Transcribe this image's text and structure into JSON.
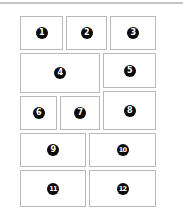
{
  "diagram": {
    "type": "layout-grid",
    "colors": {
      "border": "#b9b9b9",
      "badge_bg": "#0a0a0a",
      "badge_fg": "#ffffff",
      "top_rule": "#c4c4c4"
    },
    "panels": [
      {
        "label": "1",
        "x": 20,
        "y": 16,
        "w": 43,
        "h": 34
      },
      {
        "label": "2",
        "x": 66,
        "y": 16,
        "w": 41,
        "h": 34
      },
      {
        "label": "3",
        "x": 110,
        "y": 16,
        "w": 46,
        "h": 34
      },
      {
        "label": "4",
        "x": 20,
        "y": 53,
        "w": 80,
        "h": 40
      },
      {
        "label": "5",
        "x": 103,
        "y": 53,
        "w": 53,
        "h": 35
      },
      {
        "label": "6",
        "x": 20,
        "y": 96,
        "w": 37,
        "h": 34
      },
      {
        "label": "7",
        "x": 60,
        "y": 96,
        "w": 40,
        "h": 34
      },
      {
        "label": "8",
        "x": 103,
        "y": 91,
        "w": 53,
        "h": 39
      },
      {
        "label": "9",
        "x": 20,
        "y": 133,
        "w": 66,
        "h": 34
      },
      {
        "label": "10",
        "x": 89,
        "y": 133,
        "w": 67,
        "h": 34
      },
      {
        "label": "11",
        "x": 20,
        "y": 170,
        "w": 66,
        "h": 37
      },
      {
        "label": "12",
        "x": 89,
        "y": 170,
        "w": 67,
        "h": 37
      }
    ]
  }
}
